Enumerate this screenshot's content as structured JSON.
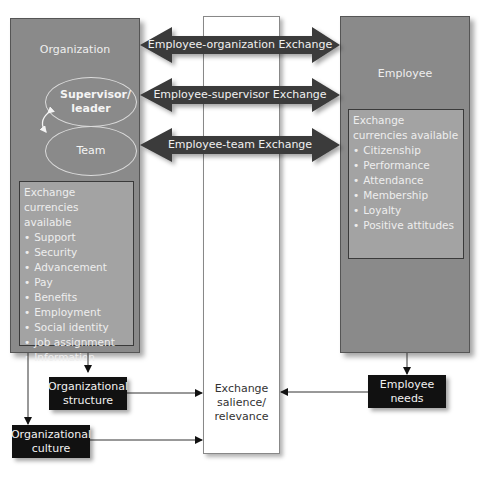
{
  "diagram": {
    "organization": {
      "title": "Organization",
      "supervisor_label": "Supervisor/ leader",
      "team_label": "Team",
      "currencies_header": "Exchange currencies available",
      "currencies": [
        "Support",
        "Security",
        "Advancement",
        "Pay",
        "Benefits",
        "Employment",
        "Social identity",
        "Job assignment",
        "Information"
      ]
    },
    "employee": {
      "title": "Employee",
      "currencies_header": "Exchange currencies available",
      "currencies": [
        "Citizenship",
        "Performance",
        "Attendance",
        "Membership",
        "Loyalty",
        "Positive attitudes"
      ]
    },
    "exchanges": [
      {
        "label": "Employee-organization Exchange"
      },
      {
        "label": "Employee-supervisor Exchange"
      },
      {
        "label": "Employee-team Exchange"
      }
    ],
    "center": {
      "label_lines": [
        "Exchange",
        "salience/",
        "relevance"
      ]
    },
    "factors": {
      "org_structure": {
        "line1": "Organizational",
        "line2": "structure"
      },
      "org_culture": {
        "line1": "Organizational",
        "line2": "culture"
      },
      "employee_needs": {
        "line1": "Employee",
        "line2": "needs"
      }
    },
    "colors": {
      "panel": "#8a8a8a",
      "currency_box": "#a3a3a3",
      "arrow": "#3a3a3a",
      "factor_box": "#111111"
    }
  }
}
